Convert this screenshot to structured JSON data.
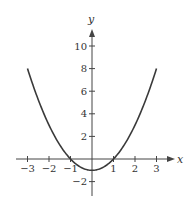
{
  "chart_data": {
    "type": "line",
    "title": "",
    "function": "y = x^2 - 1",
    "xlabel": "x",
    "ylabel": "y",
    "xlim": [
      -3.5,
      3.8
    ],
    "ylim": [
      -3.3,
      11.5
    ],
    "x_ticks": [
      -3,
      -2,
      -1,
      1,
      2,
      3
    ],
    "x_tick_labels": [
      "−3",
      "−2",
      "−1",
      "1",
      "2",
      "3"
    ],
    "y_ticks": [
      10,
      8,
      6,
      4,
      2,
      -2
    ],
    "y_tick_labels": [
      "10",
      "8",
      "6",
      "4",
      "2",
      "−2"
    ],
    "grid": false,
    "legend": null,
    "series": [
      {
        "name": "y = x^2 - 1",
        "x": [
          -3,
          -2.5,
          -2,
          -1.5,
          -1,
          -0.5,
          0,
          0.5,
          1,
          1.5,
          2,
          2.5,
          3
        ],
        "y": [
          8,
          5.25,
          3,
          1.25,
          0,
          -0.75,
          -1,
          -0.75,
          0,
          1.25,
          3,
          5.25,
          8
        ]
      }
    ],
    "colors": {
      "curve": "#3a3a3a",
      "axes": "#444444",
      "text": "#333333"
    }
  }
}
